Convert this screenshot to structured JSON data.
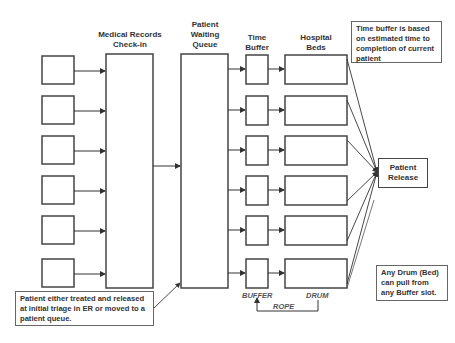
{
  "headers": {
    "checkin": "Medical Records\nCheck-in",
    "queue": "Patient\nWaiting\nQueue",
    "buffer": "Time\nBuffer",
    "beds": "Hospital\nBeds"
  },
  "release_label": "Patient\nRelease",
  "notes": {
    "time_buffer": "Time buffer is based\non estimated time to\ncompletion of current\npatient",
    "triage": "Patient either treated and released\nat initial triage in ER or moved to a\npatient queue.",
    "drum": "Any Drum (Bed)\ncan pull from\nany Buffer slot."
  },
  "tags": {
    "buffer": "BUFFER",
    "rope": "ROPE",
    "drum": "DRUM"
  },
  "rows": {
    "intake_y": [
      56,
      96,
      136,
      176,
      216,
      259
    ],
    "slot_y": [
      55,
      96,
      136,
      176,
      216,
      259
    ]
  },
  "colors": {
    "stroke": "#444444",
    "text": "#333333"
  }
}
